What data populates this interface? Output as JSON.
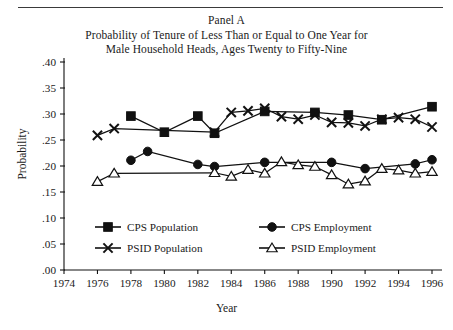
{
  "figure": {
    "panel_label": "Panel A",
    "title_line_1": "Probability of Tenure of Less Than or Equal to One Year for",
    "title_line_2": "Male Household Heads, Ages Twenty to Fifty-Nine",
    "ylabel": "Probability",
    "xlabel": "Year",
    "line_color": "#111111",
    "text_color": "#1a1a1a",
    "background": "#ffffff"
  },
  "chart_data": {
    "type": "line",
    "title": "Probability of Tenure of Less Than or Equal to One Year for Male Household Heads, Ages Twenty to Fifty-Nine",
    "subtitle": "Panel A",
    "xlabel": "Year",
    "ylabel": "Probability",
    "xlim": [
      1974,
      1996
    ],
    "ylim": [
      0.0,
      0.4
    ],
    "xticks": [
      1974,
      1976,
      1978,
      1980,
      1982,
      1984,
      1986,
      1988,
      1990,
      1992,
      1994,
      1996
    ],
    "xtick_labels": [
      "1974",
      "1976",
      "1978",
      "1980",
      "1982",
      "1984",
      "1986",
      "1988",
      "1990",
      "1992",
      "1994",
      "1996"
    ],
    "yticks": [
      0.0,
      0.05,
      0.1,
      0.15,
      0.2,
      0.25,
      0.3,
      0.35,
      0.4
    ],
    "ytick_labels": [
      ".00",
      ".05",
      ".10",
      ".15",
      ".20",
      ".25",
      ".30",
      ".35",
      ".40"
    ],
    "grid": false,
    "legend_position": "inside-lower-center",
    "series": [
      {
        "name": "CPS Population",
        "marker": "filled-square",
        "x": [
          1978,
          1980,
          1982,
          1983,
          1986,
          1989,
          1991,
          1993,
          1996
        ],
        "values": [
          0.296,
          0.265,
          0.296,
          0.263,
          0.305,
          0.303,
          0.298,
          0.289,
          0.314
        ]
      },
      {
        "name": "CPS Employment",
        "marker": "filled-circle",
        "x": [
          1978,
          1979,
          1982,
          1983,
          1986,
          1990,
          1992,
          1995,
          1996
        ],
        "values": [
          0.211,
          0.228,
          0.203,
          0.199,
          0.207,
          0.207,
          0.195,
          0.204,
          0.212
        ]
      },
      {
        "name": "PSID Population",
        "marker": "cross-x",
        "x": [
          1976,
          1977,
          1983,
          1984,
          1985,
          1986,
          1987,
          1988,
          1989,
          1990,
          1991,
          1992,
          1993,
          1994,
          1995,
          1996
        ],
        "values": [
          0.259,
          0.272,
          0.265,
          0.303,
          0.306,
          0.311,
          0.295,
          0.29,
          0.298,
          0.284,
          0.283,
          0.277,
          0.29,
          0.293,
          0.29,
          0.275
        ]
      },
      {
        "name": "PSID Employment",
        "marker": "open-triangle",
        "x": [
          1976,
          1977,
          1983,
          1984,
          1985,
          1986,
          1987,
          1988,
          1989,
          1990,
          1991,
          1992,
          1993,
          1994,
          1995,
          1996
        ],
        "values": [
          0.17,
          0.186,
          0.187,
          0.18,
          0.193,
          0.186,
          0.208,
          0.202,
          0.199,
          0.183,
          0.165,
          0.171,
          0.195,
          0.192,
          0.186,
          0.189
        ]
      }
    ],
    "legend": [
      {
        "label": "CPS Population",
        "marker": "filled-square"
      },
      {
        "label": "CPS Employment",
        "marker": "filled-circle"
      },
      {
        "label": "PSID Population",
        "marker": "cross-x"
      },
      {
        "label": "PSID Employment",
        "marker": "open-triangle"
      }
    ]
  }
}
